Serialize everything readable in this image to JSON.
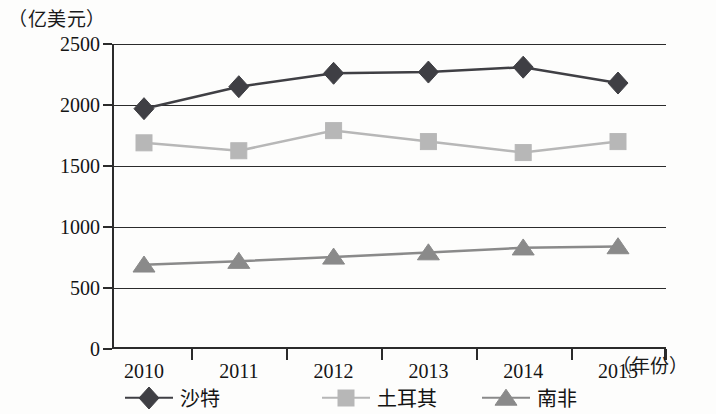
{
  "axes": {
    "y_unit_label": "（亿美元）",
    "x_unit_label": "（年份）",
    "y_ticks": [
      "0",
      "500",
      "1000",
      "1500",
      "2000",
      "2500"
    ],
    "x_ticks": [
      "2010",
      "2011",
      "2012",
      "2013",
      "2014",
      "2015"
    ]
  },
  "legend": [
    {
      "label": "沙特",
      "marker": "diamond-marker-icon",
      "color": "#3f3f44"
    },
    {
      "label": "土耳其",
      "marker": "square-marker-icon",
      "color": "#b7b7b7"
    },
    {
      "label": "南非",
      "marker": "triangle-marker-icon",
      "color": "#8a8a8a"
    }
  ],
  "chart_data": {
    "type": "line",
    "title": "",
    "xlabel": "（年份）",
    "ylabel": "（亿美元）",
    "categories": [
      "2010",
      "2011",
      "2012",
      "2013",
      "2014",
      "2015"
    ],
    "ylim": [
      0,
      2500
    ],
    "yticks": [
      0,
      500,
      1000,
      1500,
      2000,
      2500
    ],
    "grid": true,
    "legend_position": "bottom",
    "series": [
      {
        "name": "沙特",
        "marker": "diamond",
        "color": "#3f3f44",
        "values": [
          1970,
          2150,
          2260,
          2270,
          2310,
          2180
        ]
      },
      {
        "name": "土耳其",
        "marker": "square",
        "color": "#b7b7b7",
        "values": [
          1690,
          1625,
          1790,
          1700,
          1610,
          1700
        ]
      },
      {
        "name": "南非",
        "marker": "triangle",
        "color": "#8a8a8a",
        "values": [
          690,
          720,
          755,
          790,
          830,
          840
        ]
      }
    ]
  }
}
